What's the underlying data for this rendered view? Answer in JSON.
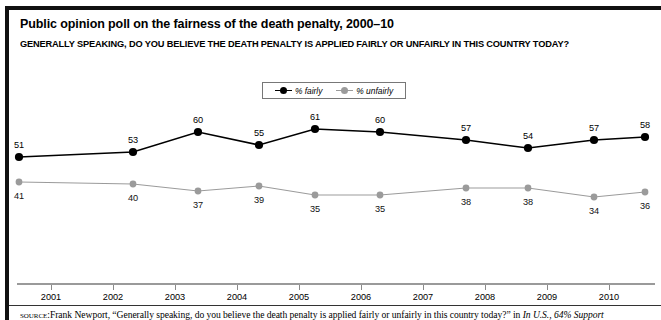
{
  "figure": {
    "title": "Public opinion poll on the fairness of the death penalty, 2000–10",
    "subtitle": "GENERALLY SPEAKING, DO YOU BELIEVE THE DEATH PENALTY IS APPLIED FAIRLY OR UNFAIRLY IN THIS COUNTRY TODAY?",
    "source_prefix": "source:",
    "source_text": "Frank Newport, “Generally speaking, do you believe the death penalty is applied fairly or unfairly in this country today?” in ",
    "source_italic": "In U.S., 64% Support"
  },
  "legend": {
    "position": "top-center",
    "items": [
      {
        "label": "% fairly",
        "color": "#000000",
        "marker": "filled-circle-dark"
      },
      {
        "label": "% unfairly",
        "color": "#9b9b9b",
        "marker": "filled-circle-gray"
      }
    ]
  },
  "chart_data": {
    "type": "line",
    "title": "Public opinion poll on the fairness of the death penalty, 2000–10",
    "subtitle": "GENERALLY SPEAKING, DO YOU BELIEVE THE DEATH PENALTY IS APPLIED FAIRLY OR UNFAIRLY IN THIS COUNTRY TODAY?",
    "xlabel": "",
    "ylabel": "",
    "grid": false,
    "legend_position": "top-center",
    "axis_ticks": [
      "2001",
      "2002",
      "2003",
      "2004",
      "2005",
      "2006",
      "2007",
      "2008",
      "2009",
      "2010"
    ],
    "x": [
      2000,
      2001.85,
      2002.9,
      2003.9,
      2004.8,
      2005.85,
      2007.25,
      2008.25,
      2009.3,
      2010.0
    ],
    "ylim": [
      30,
      65
    ],
    "series": [
      {
        "name": "% fairly",
        "color": "#000000",
        "values": [
          51,
          53,
          60,
          55,
          61,
          60,
          57,
          54,
          57,
          58
        ],
        "labels": [
          "51",
          "53",
          "60",
          "55",
          "61",
          "60",
          "57",
          "54",
          "57",
          "58"
        ]
      },
      {
        "name": "% unfairly",
        "color": "#9b9b9b",
        "values": [
          41,
          40,
          37,
          39,
          35,
          35,
          38,
          38,
          34,
          36
        ],
        "labels": [
          "41",
          "40",
          "37",
          "39",
          "35",
          "35",
          "38",
          "38",
          "34",
          "36"
        ]
      }
    ]
  },
  "points": {
    "px": [
      19,
      133,
      198,
      259,
      315,
      380,
      466,
      528,
      594,
      645
    ],
    "fairly_py": [
      157,
      152,
      132,
      145,
      129,
      132,
      140,
      148,
      140,
      137
    ],
    "unfairly_py": [
      182,
      184,
      191,
      186,
      195,
      195,
      188,
      188,
      197,
      192
    ],
    "fairly_label_pos": [
      {
        "x": 19,
        "y": 141
      },
      {
        "x": 133,
        "y": 136
      },
      {
        "x": 198,
        "y": 116
      },
      {
        "x": 259,
        "y": 129
      },
      {
        "x": 315,
        "y": 113
      },
      {
        "x": 380,
        "y": 116
      },
      {
        "x": 466,
        "y": 124
      },
      {
        "x": 528,
        "y": 132
      },
      {
        "x": 594,
        "y": 124
      },
      {
        "x": 645,
        "y": 121
      }
    ],
    "unfairly_label_pos": [
      {
        "x": 19,
        "y": 192
      },
      {
        "x": 133,
        "y": 194
      },
      {
        "x": 198,
        "y": 201
      },
      {
        "x": 259,
        "y": 196
      },
      {
        "x": 315,
        "y": 205
      },
      {
        "x": 380,
        "y": 205
      },
      {
        "x": 466,
        "y": 198
      },
      {
        "x": 528,
        "y": 198
      },
      {
        "x": 594,
        "y": 207
      },
      {
        "x": 645,
        "y": 202
      }
    ]
  },
  "xaxis": {
    "ticks": [
      {
        "label": "2001",
        "x": 51
      },
      {
        "label": "2002",
        "x": 113
      },
      {
        "label": "2003",
        "x": 175
      },
      {
        "label": "2004",
        "x": 237
      },
      {
        "label": "2005",
        "x": 299
      },
      {
        "label": "2006",
        "x": 361
      },
      {
        "label": "2007",
        "x": 423
      },
      {
        "label": "2008",
        "x": 485
      },
      {
        "label": "2009",
        "x": 547
      },
      {
        "label": "2010",
        "x": 609
      }
    ]
  }
}
